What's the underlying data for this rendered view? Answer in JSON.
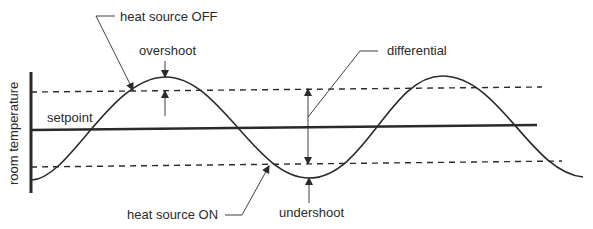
{
  "diagram": {
    "y_axis_label": "room temperature",
    "labels": {
      "heat_source_off": "heat source  OFF",
      "heat_source_on": "heat source  ON",
      "overshoot": "overshoot",
      "undershoot": "undershoot",
      "differential": "differential",
      "setpoint": "setpoint"
    },
    "colors": {
      "line": "#2a2a2a",
      "background": "#ffffff"
    }
  }
}
